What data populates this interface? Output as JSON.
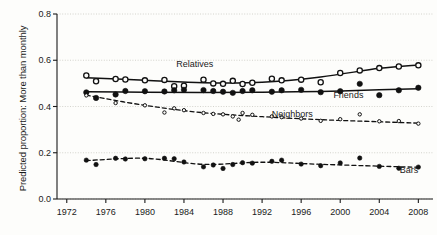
{
  "chart_data": {
    "type": "line",
    "title": "",
    "xlabel": "",
    "ylabel": "Predicted proportion: More than monthly",
    "xlim": [
      1971,
      2009.5
    ],
    "ylim": [
      0.0,
      0.8
    ],
    "grid": true,
    "legend_position": "inline-annotations",
    "xticks": [
      1972,
      1976,
      1980,
      1984,
      1988,
      1992,
      1996,
      2000,
      2004,
      2008
    ],
    "xticklabels": [
      "1972",
      "1976",
      "1980",
      "1984",
      "1988",
      "1992",
      "1996",
      "2000",
      "2004",
      "2008"
    ],
    "yticks": [
      0.0,
      0.2,
      0.4,
      0.6,
      0.8
    ],
    "yticklabels": [
      "0.0",
      "0.2",
      "0.4",
      "0.6",
      "0.8"
    ],
    "series": [
      {
        "name": "Relatives",
        "marker": "open-circle",
        "marker_size": 5.2,
        "line_style": "solid",
        "color": "#111111",
        "label_x": 1983.2,
        "label_y": 0.556,
        "x": [
          1974,
          1975,
          1977,
          1978,
          1980,
          1982,
          1983,
          1984,
          1986,
          1987,
          1988,
          1989,
          1990,
          1991,
          1993,
          1994,
          1996,
          1998,
          2000,
          2002,
          2004,
          2006,
          2008
        ],
        "y": [
          0.534,
          0.509,
          0.519,
          0.517,
          0.513,
          0.515,
          0.488,
          0.49,
          0.516,
          0.5,
          0.498,
          0.511,
          0.497,
          0.503,
          0.52,
          0.513,
          0.516,
          0.505,
          0.545,
          0.556,
          0.566,
          0.573,
          0.578
        ],
        "fit_x": [
          1974,
          1980,
          1986,
          1992,
          1998,
          2004,
          2008
        ],
        "fit_y": [
          0.524,
          0.514,
          0.503,
          0.505,
          0.528,
          0.565,
          0.58
        ]
      },
      {
        "name": "Friends",
        "marker": "filled-circle",
        "marker_size": 5.4,
        "line_style": "solid",
        "color": "#111111",
        "label_x": 1999.3,
        "label_y": 0.424,
        "x": [
          1974,
          1975,
          1977,
          1978,
          1980,
          1982,
          1983,
          1984,
          1986,
          1987,
          1988,
          1989,
          1990,
          1991,
          1993,
          1994,
          1996,
          1998,
          2000,
          2002,
          2004,
          2006,
          2008
        ],
        "y": [
          0.461,
          0.437,
          0.452,
          0.467,
          0.466,
          0.465,
          0.47,
          0.472,
          0.471,
          0.467,
          0.464,
          0.459,
          0.467,
          0.47,
          0.464,
          0.47,
          0.472,
          0.462,
          0.466,
          0.498,
          0.449,
          0.47,
          0.481
        ],
        "fit_x": [
          1974,
          1980,
          1986,
          1992,
          1998,
          2004,
          2008
        ],
        "fit_y": [
          0.464,
          0.462,
          0.461,
          0.462,
          0.465,
          0.472,
          0.477
        ]
      },
      {
        "name": "Neighbors",
        "marker": "small-open-circle",
        "marker_size": 3.4,
        "line_style": "dashed",
        "color": "#111111",
        "label_x": 1993.0,
        "label_y": 0.343,
        "legend_marker_x": 1989.6,
        "x": [
          1974,
          1977,
          1980,
          1982,
          1983,
          1984,
          1986,
          1987,
          1988,
          1989,
          1990,
          1991,
          1993,
          1994,
          1996,
          1998,
          2000,
          2002,
          2004,
          2006,
          2008
        ],
        "y": [
          0.448,
          0.415,
          0.405,
          0.374,
          0.392,
          0.384,
          0.372,
          0.368,
          0.366,
          0.357,
          0.372,
          0.364,
          0.357,
          0.354,
          0.348,
          0.338,
          0.345,
          0.366,
          0.336,
          0.337,
          0.326
        ],
        "fit_x": [
          1974,
          1980,
          1986,
          1992,
          1998,
          2004,
          2008
        ],
        "fit_y": [
          0.449,
          0.405,
          0.373,
          0.356,
          0.343,
          0.334,
          0.328
        ]
      },
      {
        "name": "Bars",
        "marker": "filled-circle",
        "marker_size": 4.4,
        "line_style": "dashed",
        "color": "#111111",
        "label_x": 2006.1,
        "label_y": 0.098,
        "x": [
          1974,
          1975,
          1977,
          1978,
          1980,
          1982,
          1983,
          1984,
          1986,
          1987,
          1988,
          1989,
          1990,
          1991,
          1993,
          1994,
          1996,
          1998,
          2000,
          2002,
          2004,
          2006,
          2008
        ],
        "y": [
          0.168,
          0.149,
          0.176,
          0.173,
          0.174,
          0.176,
          0.174,
          0.16,
          0.139,
          0.147,
          0.132,
          0.149,
          0.157,
          0.155,
          0.163,
          0.168,
          0.151,
          0.144,
          0.156,
          0.177,
          0.141,
          0.133,
          0.138
        ],
        "fit_x": [
          1974,
          1980,
          1986,
          1992,
          1998,
          2004,
          2008
        ],
        "fit_y": [
          0.166,
          0.176,
          0.15,
          0.159,
          0.15,
          0.142,
          0.137
        ]
      }
    ]
  }
}
